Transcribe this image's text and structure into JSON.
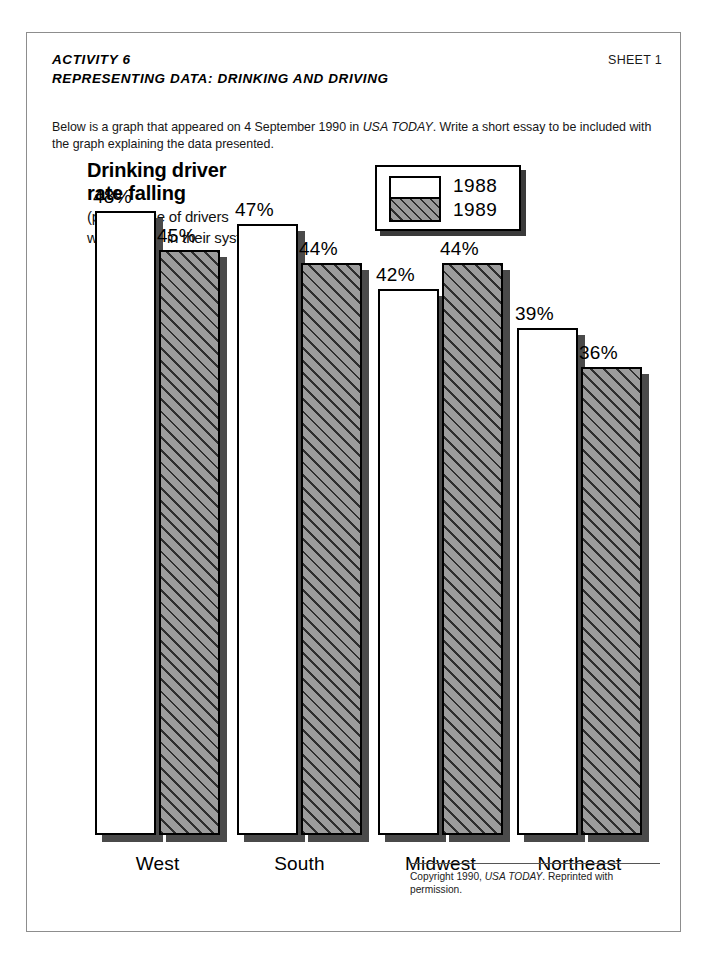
{
  "header": {
    "activity": "ACTIVITY 6",
    "subtitle": "REPRESENTING DATA: DRINKING AND DRIVING",
    "sheet": "SHEET 1"
  },
  "intro": {
    "part1": "Below is a graph that appeared on 4 September 1990 in ",
    "source": "USA TODAY",
    "part2": ". Write a short essay to be included with the graph explaining the data presented."
  },
  "copyright": {
    "part1": "Copyright 1990, ",
    "source": "USA TODAY",
    "part2": ". Reprinted with permission."
  },
  "chart_data": {
    "type": "bar",
    "title": "Drinking driver rate falling",
    "title_line1": "Drinking driver",
    "title_line2": "rate falling",
    "subtitle_line1": "(percentage of drivers",
    "subtitle_line2": "with alcohol in their system)",
    "xlabel": "",
    "ylabel": "percentage of drivers with alcohol in their system",
    "grid": false,
    "legend_position": "top-right",
    "axis_baseline_value": 0,
    "ylim": [
      0,
      50
    ],
    "categories": [
      "West",
      "South",
      "Midwest",
      "Northeast"
    ],
    "series": [
      {
        "name": "1988",
        "fill": "white",
        "values": [
          48,
          47,
          42,
          39
        ],
        "labels": [
          "48%",
          "47%",
          "42%",
          "39%"
        ]
      },
      {
        "name": "1989",
        "fill": "gray-hatched",
        "values": [
          45,
          44,
          44,
          36
        ],
        "labels": [
          "45%",
          "44%",
          "44%",
          "36%"
        ]
      }
    ],
    "colors": {
      "series_1988": "#ffffff",
      "series_1989": "#9c9c9c",
      "outline": "#000000",
      "shadow": "#4a4a4a",
      "page_border": "#8d8d8d"
    }
  }
}
